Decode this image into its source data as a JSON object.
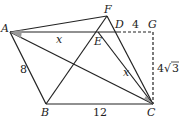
{
  "diagram": {
    "points": {
      "A": {
        "label": "A",
        "x": 10,
        "y": 32
      },
      "F": {
        "label": "F",
        "x": 107,
        "y": 16
      },
      "D": {
        "label": "D",
        "x": 118,
        "y": 32
      },
      "G": {
        "label": "G",
        "x": 153,
        "y": 32
      },
      "E": {
        "label": "E",
        "x": 98,
        "y": 32
      },
      "B": {
        "label": "B",
        "x": 46,
        "y": 104
      },
      "C": {
        "label": "C",
        "x": 153,
        "y": 104
      }
    },
    "labels": {
      "AB": "8",
      "BC": "12",
      "DG": "4",
      "GC_coef": "4",
      "GC_rad": "3",
      "AE": "x",
      "EC": "x"
    },
    "colors": {
      "line": "#222222",
      "angle_fill": "#999999"
    }
  }
}
